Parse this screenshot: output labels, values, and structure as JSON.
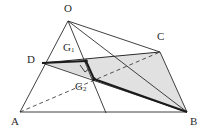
{
  "figure": {
    "width": 205,
    "height": 135,
    "background_color": "#ffffff",
    "stroke_color": "#2b2b2b",
    "shade_color": "#dcdcdc",
    "points": {
      "O": {
        "x": 68,
        "y": 21,
        "label": "O",
        "label_x": 64,
        "label_y": 3
      },
      "A": {
        "x": 20,
        "y": 112,
        "label": "A",
        "label_x": 13,
        "label_y": 116
      },
      "B": {
        "x": 187,
        "y": 112,
        "label": "B",
        "label_x": 190,
        "label_y": 116
      },
      "C": {
        "x": 160,
        "y": 52,
        "label": "C",
        "label_x": 158,
        "label_y": 33
      },
      "D": {
        "x": 42,
        "y": 63,
        "label": "D",
        "label_x": 28,
        "label_y": 56
      },
      "G1": {
        "x": 86,
        "y": 61,
        "label": "G",
        "sub": "1",
        "label_x": 64,
        "label_y": 43
      },
      "G2": {
        "x": 94,
        "y": 79,
        "label": "G",
        "sub": "2",
        "label_x": 76,
        "label_y": 82
      }
    },
    "shaded_regions": [
      {
        "name": "quad-D-C-B-G2",
        "vertices": [
          "D",
          "C",
          "B",
          "G2"
        ]
      }
    ],
    "solid_edges": [
      {
        "name": "edge-O-A",
        "from": "O",
        "to": "A"
      },
      {
        "name": "edge-O-B",
        "from": "O",
        "to": "B"
      },
      {
        "name": "edge-O-C",
        "from": "O",
        "to": "C"
      },
      {
        "name": "edge-O-G2-extended",
        "from": "O",
        "to": "G2"
      },
      {
        "name": "edge-A-B",
        "from": "A",
        "to": "B"
      },
      {
        "name": "edge-C-B",
        "from": "C",
        "to": "B"
      },
      {
        "name": "edge-D-C",
        "from": "D",
        "to": "C"
      },
      {
        "name": "edge-D-B",
        "from": "D",
        "to": "B"
      }
    ],
    "dashed_edges": [
      {
        "name": "edge-A-C-hidden",
        "from": "A",
        "to": "C"
      }
    ],
    "heavy_edges": [
      {
        "name": "edge-D-G1",
        "from": "D",
        "to": "G1"
      },
      {
        "name": "edge-G1-G2",
        "from": "G1",
        "to": "G2"
      },
      {
        "name": "edge-G2-B",
        "from": "G2",
        "to": "B"
      }
    ],
    "markers": {
      "right_angle": {
        "name": "right-angle-marker-at-G1G2",
        "x": 82,
        "y": 68,
        "size": 7
      },
      "dots": [
        "G1",
        "G2"
      ]
    },
    "cevian_through_G": {
      "name": "line-O-through-G2-to-base",
      "from": "O",
      "to_x": 106,
      "to_y": 113
    }
  }
}
